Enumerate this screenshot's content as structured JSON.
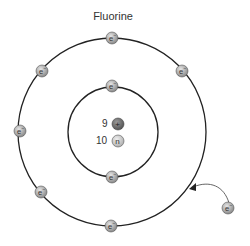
{
  "title": "Fluorine",
  "element": "Fluorine",
  "nucleus": {
    "protons": {
      "count": "9",
      "symbol": "+"
    },
    "neutrons": {
      "count": "10",
      "symbol": "n"
    }
  },
  "shells": [
    {
      "name": "inner",
      "electrons": 2
    },
    {
      "name": "outer",
      "electrons": 7
    }
  ],
  "electron_label": "e⁻",
  "incoming_electron": {
    "label": "e⁻",
    "note": "electron being added to outer shell"
  },
  "colors": {
    "electron_fill": "#a8a8a8",
    "proton_fill": "#7a7a7a",
    "neutron_fill": "#c8c8c8",
    "orbit_stroke": "#222222"
  }
}
